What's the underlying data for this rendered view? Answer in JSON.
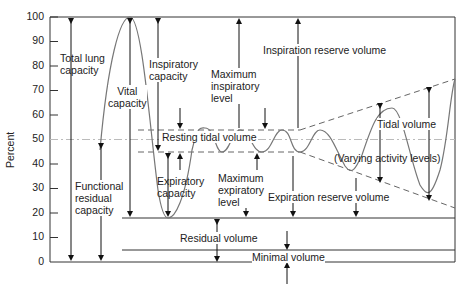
{
  "diagram": {
    "type": "lung-volumes",
    "y_axis": {
      "label": "Percent",
      "ticks": [
        "100",
        "90",
        "80",
        "70",
        "60",
        "50",
        "40",
        "30",
        "20",
        "10",
        "0"
      ]
    },
    "labels": {
      "total_lung_capacity": [
        "Total lung",
        "capacity"
      ],
      "vital_capacity": [
        "Vital",
        "capacity"
      ],
      "inspiratory_capacity": [
        "Inspiratory",
        "capacity"
      ],
      "maximum_inspiratory_level": [
        "Maximum",
        "inspiratory",
        "level"
      ],
      "inspiration_reserve_volume": "Inspiration reserve volume",
      "resting_tidal_volume": "Resting tidal volume",
      "tidal_volume": "Tidal volume",
      "varying_activity_levels": "(Varying activity levels)",
      "functional_residual_capacity": [
        "Functional",
        "residual",
        "capacity"
      ],
      "expiratory_capacity": [
        "Expiratory",
        "capacity"
      ],
      "maximum_expiratory_level": [
        "Maximum",
        "expiratory",
        "level"
      ],
      "expiration_reserve_volume": "Expiration reserve volume",
      "residual_volume": "Residual volume",
      "minimal_volume": "Minimal volume"
    },
    "colors": {
      "line": "#333333",
      "curve": "#777777",
      "dashed": "#666666",
      "midline": "#bbbbbb"
    }
  }
}
